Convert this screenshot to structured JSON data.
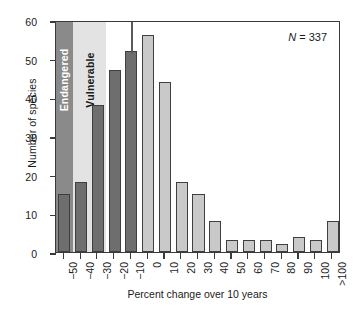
{
  "chart_data": {
    "type": "bar",
    "title": "",
    "subtitle": "",
    "xlabel": "Percent change over 10 years",
    "ylabel": "Number of species",
    "categories": [
      "−50",
      "−40",
      "−30",
      "−20",
      "−10",
      "0",
      "10",
      "20",
      "30",
      "40",
      "50",
      "60",
      "70",
      "80",
      "90",
      "100",
      ">100"
    ],
    "values": [
      15,
      18,
      38,
      47,
      52,
      56,
      44,
      18,
      15,
      8,
      3,
      3,
      3,
      2,
      4,
      3,
      8
    ],
    "ylim": [
      0,
      60
    ],
    "yticks": [
      0,
      10,
      20,
      30,
      40,
      50,
      60
    ],
    "grid": false,
    "legend_position": "none",
    "bar_colors": [
      "#6e6e6e",
      "#6e6e6e",
      "#6e6e6e",
      "#6e6e6e",
      "#6e6e6e",
      "#c9c9c9",
      "#c9c9c9",
      "#c9c9c9",
      "#c9c9c9",
      "#c9c9c9",
      "#c9c9c9",
      "#c9c9c9",
      "#c9c9c9",
      "#c9c9c9",
      "#c9c9c9",
      "#c9c9c9",
      "#c9c9c9"
    ],
    "annotations": [
      {
        "name": "sample-size",
        "text_italic": "N",
        "text": " = 337",
        "position": "top-right"
      }
    ],
    "bands": [
      {
        "label": "Endangered",
        "color": "#8a8a8a",
        "text_color": "#ffffff",
        "start_index": 0,
        "end_index": 1
      },
      {
        "label": "Vulnerable",
        "color": "#e3e3e3",
        "text_color": "#1a1a1a",
        "start_index": 1,
        "end_index": 3
      }
    ],
    "reference_lines": [
      {
        "name": "threshold-line",
        "at_index": 4.5,
        "color": "#5a5a5a"
      }
    ]
  },
  "annotation": {
    "n_symbol": "N",
    "n_value": " = 337"
  },
  "axis": {
    "x_title": "Percent change over 10 years",
    "y_title": "Number of species"
  },
  "bands": {
    "endangered": "Endangered",
    "vulnerable": "Vulnerable"
  }
}
